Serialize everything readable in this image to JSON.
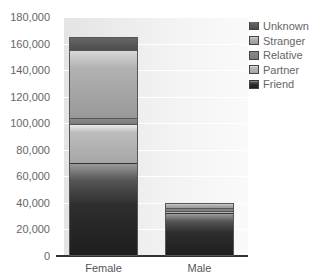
{
  "chart_data": {
    "type": "bar",
    "stacked": true,
    "title": "",
    "xlabel": "",
    "ylabel": "",
    "categories": [
      "Female",
      "Male"
    ],
    "series": [
      {
        "name": "Friend",
        "values": [
          69000,
          31500
        ],
        "color": "#222222"
      },
      {
        "name": "Partner",
        "values": [
          30000,
          2000
        ],
        "color": "#b0b0b0"
      },
      {
        "name": "Relative",
        "values": [
          4000,
          2000
        ],
        "color": "#7e7e7e"
      },
      {
        "name": "Stranger",
        "values": [
          51500,
          4000
        ],
        "color": "#a8a8a8"
      },
      {
        "name": "Unknown",
        "values": [
          10500,
          500
        ],
        "color": "#555555"
      }
    ],
    "totals": [
      165000,
      40000
    ],
    "ylim": [
      0,
      180000
    ],
    "yticks": [
      "0",
      "20,000",
      "40,000",
      "60,000",
      "80,000",
      "100,000",
      "120,000",
      "140,000",
      "160,000",
      "180,000"
    ],
    "grid": true,
    "legend_position": "right",
    "legend_order": [
      "Unknown",
      "Stranger",
      "Relative",
      "Partner",
      "Friend"
    ]
  },
  "legend": {
    "items": [
      {
        "label": "Unknown",
        "key": "unknown"
      },
      {
        "label": "Stranger",
        "key": "stranger"
      },
      {
        "label": "Relative",
        "key": "relative"
      },
      {
        "label": "Partner",
        "key": "partner"
      },
      {
        "label": "Friend",
        "key": "friend"
      }
    ]
  }
}
